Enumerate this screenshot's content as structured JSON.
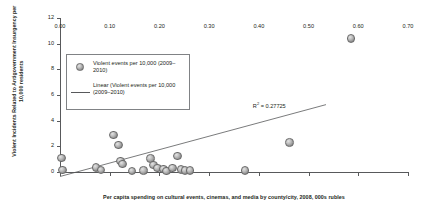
{
  "chart_data": {
    "type": "scatter",
    "title": "",
    "xlabel": "Per capita spending on cultural events, cinemas, and media by county/city, 2008, 000s rubles",
    "ylabel": "Violent Incidents Related to Antigovernment Insurgency per 10,000 residents",
    "xlim": [
      0.0,
      0.7
    ],
    "ylim": [
      0,
      12
    ],
    "xticks": [
      "0.00",
      "0.10",
      "0.20",
      "0.30",
      "0.40",
      "0.50",
      "0.60",
      "0.70"
    ],
    "xtick_values": [
      0.0,
      0.1,
      0.2,
      0.3,
      0.4,
      0.5,
      0.6,
      0.7
    ],
    "yticks": [
      "0",
      "2",
      "4",
      "6",
      "8",
      "10",
      "12"
    ],
    "ytick_values": [
      0,
      2,
      4,
      6,
      8,
      10,
      12
    ],
    "grid": false,
    "legend_position": "upper-left-inside",
    "series": [
      {
        "name": "Violent events per 10,000 (2009–2010)",
        "marker": "circle",
        "points": [
          [
            0.003,
            1.1
          ],
          [
            0.005,
            0.15
          ],
          [
            0.072,
            0.35
          ],
          [
            0.082,
            0.15
          ],
          [
            0.108,
            2.9
          ],
          [
            0.118,
            2.1
          ],
          [
            0.122,
            0.85
          ],
          [
            0.126,
            0.6
          ],
          [
            0.145,
            0.1
          ],
          [
            0.168,
            0.12
          ],
          [
            0.182,
            1.05
          ],
          [
            0.188,
            0.55
          ],
          [
            0.196,
            0.3
          ],
          [
            0.208,
            0.25
          ],
          [
            0.214,
            0.1
          ],
          [
            0.226,
            0.3
          ],
          [
            0.236,
            1.25
          ],
          [
            0.244,
            0.2
          ],
          [
            0.252,
            0.12
          ],
          [
            0.262,
            0.12
          ],
          [
            0.372,
            0.12
          ],
          [
            0.462,
            2.3
          ],
          [
            0.585,
            10.4
          ]
        ]
      }
    ],
    "trendline": {
      "name": "Linear (Violent events per 10,000 (2009–2010)",
      "x_start": 0.0,
      "y_start": -0.35,
      "x_end": 0.535,
      "y_end": 5.25,
      "r_squared_label": "R",
      "r_squared_sup": "2",
      "r_squared_value": "= 0.27725"
    },
    "legend": {
      "entries": [
        {
          "marker": "circle",
          "label": "Violent events per 10,000 (2009–2010)"
        },
        {
          "marker": "line",
          "label": "Linear (Violent events per 10,000 (2009–2010)"
        }
      ]
    }
  }
}
